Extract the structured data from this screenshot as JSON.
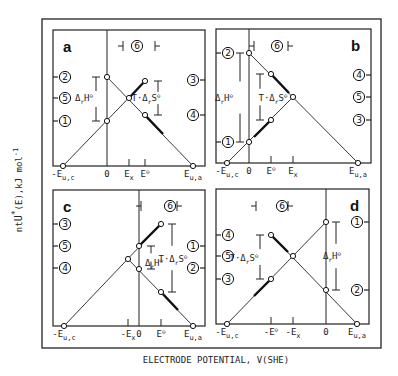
{
  "figure": {
    "ylabel": "ntU*(E),kJ mol-1",
    "ylabel_parts": {
      "pre": "nt",
      "U": "U",
      "star": "*",
      "arg": "(E),kJ mol",
      "exp": "-1"
    },
    "xlabel": "ELECTRODE POTENTIAL, V(SHE)",
    "outer_frame": {
      "x": 42,
      "y": 19,
      "w": 339,
      "h": 329
    },
    "panels": [
      {
        "id": "a",
        "letter": "a",
        "box": {
          "x": 53,
          "y": 30,
          "w": 152,
          "h": 136
        },
        "vertical_line_x": 107,
        "letter_pos": [
          63,
          52
        ],
        "six_label": {
          "x": 130,
          "y": 46,
          "left_bar": [
            118,
            123
          ],
          "right_bar": [
            155,
            160
          ]
        },
        "left_ticks": [
          {
            "label": "2",
            "y": 77
          },
          {
            "label": "5",
            "y": 98
          },
          {
            "label": "1",
            "y": 121
          }
        ],
        "right_ticks": [
          {
            "label": "3",
            "y": 80
          },
          {
            "label": "4",
            "y": 115
          }
        ],
        "lines": [
          {
            "from": [
              63,
              166
            ],
            "to": [
              145,
              81
            ]
          },
          {
            "from": [
              107,
              77
            ],
            "to": [
              193,
              166
            ]
          }
        ],
        "thick": [
          {
            "from": [
              129,
              98
            ],
            "to": [
              145,
              81
            ]
          },
          {
            "from": [
              145,
              115
            ],
            "to": [
              163,
              134
            ]
          }
        ],
        "points": [
          [
            63,
            166
          ],
          [
            107,
            77
          ],
          [
            107,
            121
          ],
          [
            129,
            98
          ],
          [
            145,
            81
          ],
          [
            145,
            115
          ],
          [
            193,
            166
          ]
        ],
        "brackets": [
          {
            "x": 96,
            "y1": 77,
            "y2": 121,
            "label": "ΔrH⊖",
            "lx": 84,
            "ly": 101,
            "side": "left"
          },
          {
            "x": 158,
            "y1": 81,
            "y2": 115,
            "label": "T·ΔrS⊖",
            "lx": 146,
            "ly": 101,
            "side": "right"
          }
        ],
        "xticks": [
          {
            "label": "-Eu,c",
            "x": 63,
            "tick": false
          },
          {
            "label": "0",
            "x": 107,
            "tick": false
          },
          {
            "label": "Ex",
            "x": 129,
            "tick": true
          },
          {
            "label": "E⊖",
            "x": 145,
            "tick": true
          },
          {
            "label": "Eu,a",
            "x": 193,
            "tick": false
          }
        ]
      },
      {
        "id": "b",
        "letter": "b",
        "box": {
          "x": 216,
          "y": 29,
          "w": 155,
          "h": 134
        },
        "vertical_line_x": 249,
        "letter_pos": [
          351,
          51
        ],
        "six_label": {
          "x": 270,
          "y": 46,
          "left_bar": [
            249,
            254
          ],
          "right_bar": [
            288,
            293
          ]
        },
        "left_ticks": [
          {
            "label": "2",
            "y": 53
          },
          {
            "label": "1",
            "y": 142
          }
        ],
        "right_ticks": [
          {
            "label": "4",
            "y": 75
          },
          {
            "label": "5",
            "y": 97
          },
          {
            "label": "3",
            "y": 120
          }
        ],
        "lines": [
          {
            "from": [
              227,
              163
            ],
            "to": [
              293,
              97
            ]
          },
          {
            "from": [
              249,
              53
            ],
            "to": [
              358,
              163
            ]
          }
        ],
        "thick": [
          {
            "from": [
              271,
              74
            ],
            "to": [
              289,
              93
            ]
          },
          {
            "from": [
              254,
              137
            ],
            "to": [
              271,
              120
            ]
          }
        ],
        "points": [
          [
            227,
            163
          ],
          [
            249,
            53
          ],
          [
            249,
            142
          ],
          [
            271,
            74
          ],
          [
            271,
            120
          ],
          [
            293,
            97
          ],
          [
            358,
            163
          ]
        ],
        "brackets": [
          {
            "x": 240,
            "y1": 53,
            "y2": 142,
            "label": "ΔrH⊖",
            "lx": 224,
            "ly": 101,
            "side": "left"
          },
          {
            "x": 260,
            "y1": 74,
            "y2": 120,
            "label": "T·ΔrS⊖",
            "lx": 273,
            "ly": 101,
            "side": "mid"
          }
        ],
        "xticks": [
          {
            "label": "-Eu,c",
            "x": 227,
            "tick": false
          },
          {
            "label": "0",
            "x": 249,
            "tick": false
          },
          {
            "label": "E⊖",
            "x": 271,
            "tick": true
          },
          {
            "label": "Ex",
            "x": 293,
            "tick": true
          },
          {
            "label": "Eu,a",
            "x": 358,
            "tick": false
          }
        ]
      },
      {
        "id": "c",
        "letter": "c",
        "box": {
          "x": 53,
          "y": 190,
          "w": 152,
          "h": 136
        },
        "vertical_line_x": 139,
        "letter_pos": [
          63,
          212
        ],
        "six_label": {
          "x": 163,
          "y": 206,
          "left_bar": [
            136,
            141
          ],
          "right_bar": [
            177,
            182
          ]
        },
        "left_ticks": [
          {
            "label": "3",
            "y": 224
          },
          {
            "label": "5",
            "y": 246
          },
          {
            "label": "4",
            "y": 268
          }
        ],
        "right_ticks": [
          {
            "label": "1",
            "y": 246
          },
          {
            "label": "2",
            "y": 268
          }
        ],
        "lines": [
          {
            "from": [
              64,
              326
            ],
            "to": [
              161,
              224
            ]
          },
          {
            "from": [
              128,
              259
            ],
            "to": [
              193,
              326
            ]
          }
        ],
        "thick": [
          {
            "from": [
              139,
              246
            ],
            "to": [
              161,
              224
            ]
          },
          {
            "from": [
              161,
              292
            ],
            "to": [
              178,
              310
            ]
          }
        ],
        "points": [
          [
            64,
            326
          ],
          [
            128,
            259
          ],
          [
            139,
            246
          ],
          [
            139,
            269
          ],
          [
            161,
            224
          ],
          [
            161,
            292
          ],
          [
            193,
            326
          ]
        ],
        "brackets": [
          {
            "x": 151,
            "y1": 246,
            "y2": 269,
            "label": "ΔrH⊖",
            "lx": 154,
            "ly": 266,
            "side": "inner"
          },
          {
            "x": 172,
            "y1": 224,
            "y2": 292,
            "label": "T·ΔrS⊖",
            "lx": 173,
            "ly": 262,
            "side": "right"
          }
        ],
        "xticks": [
          {
            "label": "-Eu,c",
            "x": 64,
            "tick": false
          },
          {
            "label": "-Ex",
            "x": 128,
            "tick": true
          },
          {
            "label": "0",
            "x": 139,
            "tick": false
          },
          {
            "label": "E⊖",
            "x": 161,
            "tick": true
          },
          {
            "label": "Eu,a",
            "x": 193,
            "tick": false
          }
        ]
      },
      {
        "id": "d",
        "letter": "d",
        "box": {
          "x": 216,
          "y": 189,
          "w": 153,
          "h": 135
        },
        "vertical_line_x": 326,
        "letter_pos": [
          350,
          211
        ],
        "six_label": {
          "x": 275,
          "y": 206,
          "left_bar": [
            251,
            256
          ],
          "right_bar": [
            288,
            293
          ]
        },
        "left_ticks": [
          {
            "label": "4",
            "y": 235
          },
          {
            "label": "5",
            "y": 256
          },
          {
            "label": "3",
            "y": 279
          }
        ],
        "right_ticks": [
          {
            "label": "1",
            "y": 222
          },
          {
            "label": "2",
            "y": 290
          }
        ],
        "lines": [
          {
            "from": [
              227,
              324
            ],
            "to": [
              326,
              222
            ]
          },
          {
            "from": [
              271,
              235
            ],
            "to": [
              357,
              324
            ]
          }
        ],
        "thick": [
          {
            "from": [
              271,
              235
            ],
            "to": [
              288,
              252
            ]
          },
          {
            "from": [
              254,
              296
            ],
            "to": [
              271,
              279
            ]
          }
        ],
        "points": [
          [
            227,
            324
          ],
          [
            271,
            235
          ],
          [
            271,
            279
          ],
          [
            293,
            256
          ],
          [
            326,
            222
          ],
          [
            326,
            290
          ],
          [
            357,
            324
          ]
        ],
        "brackets": [
          {
            "x": 260,
            "y1": 235,
            "y2": 279,
            "label": "T·ΔrS⊖",
            "lx": 244,
            "ly": 261,
            "side": "left"
          },
          {
            "x": 336,
            "y1": 222,
            "y2": 290,
            "label": "ΔrH⊖",
            "lx": 332,
            "ly": 259,
            "side": "right"
          }
        ],
        "xticks": [
          {
            "label": "-Eu,c",
            "x": 227,
            "tick": false
          },
          {
            "label": "-E⊖",
            "x": 271,
            "tick": true
          },
          {
            "label": "-Ex",
            "x": 293,
            "tick": true
          },
          {
            "label": "0",
            "x": 326,
            "tick": false
          },
          {
            "label": "Eu,a",
            "x": 357,
            "tick": false
          }
        ]
      }
    ]
  }
}
